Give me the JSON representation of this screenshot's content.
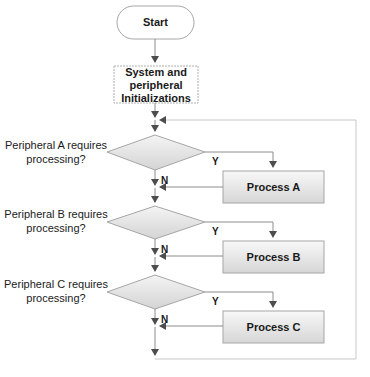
{
  "diagram": {
    "type": "flowchart",
    "colors": {
      "line": "#8c8c8c",
      "arrow": "#555555",
      "box_fill_top": "#f7f7f7",
      "box_fill_bottom": "#d9d9d9",
      "box_border": "#a6a6a6",
      "loop_line": "#c8c8c8"
    },
    "start": {
      "label": "Start"
    },
    "init": {
      "label_lines": [
        "System and",
        "peripheral",
        "Initializations"
      ]
    },
    "decisions": [
      {
        "question_lines": [
          "Peripheral A requires",
          "processing?"
        ],
        "yes_label": "Y",
        "no_label": "N",
        "process_label": "Process A"
      },
      {
        "question_lines": [
          "Peripheral B requires",
          "processing?"
        ],
        "yes_label": "Y",
        "no_label": "N",
        "process_label": "Process B"
      },
      {
        "question_lines": [
          "Peripheral C requires",
          "processing?"
        ],
        "yes_label": "Y",
        "no_label": "N",
        "process_label": "Process C"
      }
    ]
  }
}
